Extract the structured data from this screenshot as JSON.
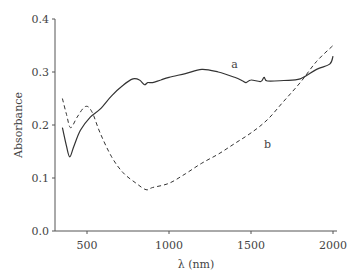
{
  "chart_data": {
    "type": "line",
    "title": "",
    "xlabel": "λ (nm)",
    "ylabel": "Absorbance",
    "xlim": [
      340,
      2010
    ],
    "ylim": [
      0.0,
      0.4
    ],
    "x_ticks": [
      500,
      1000,
      1500,
      2000
    ],
    "x_tick_labels": [
      "500",
      "1000",
      "1500",
      "2000"
    ],
    "y_ticks": [
      0.0,
      0.1,
      0.2,
      0.3,
      0.4
    ],
    "y_tick_labels": [
      "0.0",
      "0.1",
      "0.2",
      "0.3",
      "0.4"
    ],
    "grid": false,
    "legend": "none (curves labeled inline)",
    "series": [
      {
        "name": "a",
        "style": "solid",
        "x": [
          350,
          375,
          395,
          420,
          460,
          520,
          580,
          650,
          720,
          780,
          820,
          850,
          870,
          900,
          950,
          1000,
          1100,
          1200,
          1300,
          1400,
          1450,
          1470,
          1500,
          1560,
          1580,
          1600,
          1700,
          1800,
          1900,
          1980,
          2000
        ],
        "values": [
          0.195,
          0.16,
          0.14,
          0.16,
          0.19,
          0.215,
          0.23,
          0.255,
          0.275,
          0.287,
          0.285,
          0.276,
          0.28,
          0.28,
          0.285,
          0.29,
          0.297,
          0.305,
          0.3,
          0.29,
          0.283,
          0.28,
          0.285,
          0.282,
          0.29,
          0.283,
          0.284,
          0.287,
          0.305,
          0.315,
          0.33
        ]
      },
      {
        "name": "b",
        "style": "dashed",
        "x": [
          350,
          375,
          400,
          440,
          490,
          530,
          580,
          650,
          720,
          800,
          860,
          900,
          1000,
          1100,
          1200,
          1300,
          1400,
          1500,
          1600,
          1700,
          1800,
          1900,
          2000
        ],
        "values": [
          0.25,
          0.22,
          0.195,
          0.215,
          0.235,
          0.225,
          0.185,
          0.14,
          0.11,
          0.09,
          0.078,
          0.082,
          0.09,
          0.108,
          0.128,
          0.145,
          0.165,
          0.185,
          0.21,
          0.245,
          0.28,
          0.32,
          0.35
        ]
      }
    ],
    "annotations": [
      {
        "text": "a",
        "x": 1400,
        "y": 0.315
      },
      {
        "text": "b",
        "x": 1600,
        "y": 0.165
      }
    ]
  }
}
